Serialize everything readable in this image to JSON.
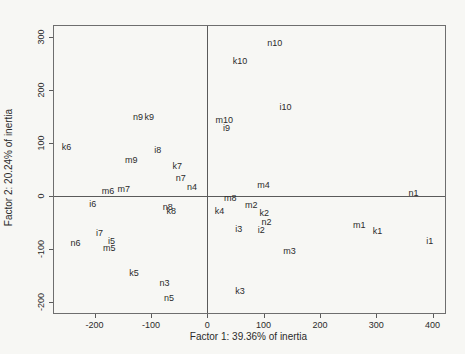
{
  "chart_data": {
    "type": "scatter",
    "title": "",
    "xlabel": "Factor 1: 39.36% of inertia",
    "ylabel": "Factor 2: 20.24% of inertia",
    "xlim": [
      -272,
      422
    ],
    "ylim": [
      -220,
      320
    ],
    "x_ticks": [
      -200,
      -100,
      0,
      100,
      200,
      300,
      400
    ],
    "y_ticks": [
      -200,
      -100,
      0,
      100,
      200,
      300
    ],
    "grid": false,
    "legend": false,
    "marker_style": "text-label",
    "text_color": "#2b2b2b",
    "reference_lines": {
      "horizontal": 0,
      "vertical": 0
    },
    "points": [
      {
        "label": "n10",
        "x": 120,
        "y": 288
      },
      {
        "label": "k10",
        "x": 58,
        "y": 255
      },
      {
        "label": "i10",
        "x": 139,
        "y": 168
      },
      {
        "label": "m10",
        "x": 30,
        "y": 143
      },
      {
        "label": "i9",
        "x": 34,
        "y": 129
      },
      {
        "label": "n9",
        "x": -123,
        "y": 148
      },
      {
        "label": "k9",
        "x": -103,
        "y": 148
      },
      {
        "label": "k6",
        "x": -250,
        "y": 93
      },
      {
        "label": "i8",
        "x": -88,
        "y": 86
      },
      {
        "label": "m9",
        "x": -135,
        "y": 68
      },
      {
        "label": "k7",
        "x": -53,
        "y": 56
      },
      {
        "label": "n7",
        "x": -47,
        "y": 34
      },
      {
        "label": "n4",
        "x": -27,
        "y": 18
      },
      {
        "label": "m7",
        "x": -148,
        "y": 14
      },
      {
        "label": "m6",
        "x": -176,
        "y": 10
      },
      {
        "label": "m4",
        "x": 100,
        "y": 20
      },
      {
        "label": "n1",
        "x": 366,
        "y": 5
      },
      {
        "label": "i6",
        "x": -203,
        "y": -14
      },
      {
        "label": "n8",
        "x": -70,
        "y": -20
      },
      {
        "label": "k8",
        "x": -64,
        "y": -29
      },
      {
        "label": "m8",
        "x": 41,
        "y": -4
      },
      {
        "label": "k4",
        "x": 22,
        "y": -29
      },
      {
        "label": "m2",
        "x": 78,
        "y": -16
      },
      {
        "label": "k2",
        "x": 101,
        "y": -32
      },
      {
        "label": "n2",
        "x": 105,
        "y": -48
      },
      {
        "label": "i3",
        "x": 56,
        "y": -62
      },
      {
        "label": "i2",
        "x": 96,
        "y": -63
      },
      {
        "label": "m1",
        "x": 270,
        "y": -54
      },
      {
        "label": "k1",
        "x": 302,
        "y": -65
      },
      {
        "label": "i1",
        "x": 395,
        "y": -84
      },
      {
        "label": "m3",
        "x": 146,
        "y": -104
      },
      {
        "label": "k3",
        "x": 58,
        "y": -179
      },
      {
        "label": "i7",
        "x": -191,
        "y": -70
      },
      {
        "label": "n6",
        "x": -234,
        "y": -89
      },
      {
        "label": "i5",
        "x": -170,
        "y": -85
      },
      {
        "label": "m5",
        "x": -174,
        "y": -97
      },
      {
        "label": "k5",
        "x": -130,
        "y": -144
      },
      {
        "label": "n3",
        "x": -76,
        "y": -164
      },
      {
        "label": "n5",
        "x": -68,
        "y": -192
      }
    ]
  }
}
